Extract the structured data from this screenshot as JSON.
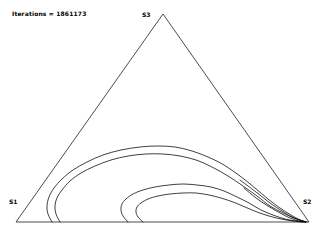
{
  "figure": {
    "iterations_label": "Iterations = 1861173",
    "iterations_prefix": "Iterations =",
    "iterations_value": "1861173",
    "line_color": "#000000",
    "background_color": "#ffffff"
  },
  "vertices": {
    "s1": {
      "label": "S1",
      "x": 16,
      "y": 222
    },
    "s2": {
      "label": "S2",
      "x": 309,
      "y": 222
    },
    "s3": {
      "label": "S3",
      "x": 163,
      "y": 14
    }
  },
  "chart_data": {
    "type": "line",
    "title": "",
    "subtitle": "",
    "xlabel": "",
    "ylabel": "",
    "grid": false,
    "legend_position": "none",
    "annotations": [
      {
        "text": "Iterations = 1861173",
        "x": 12,
        "y": 14
      },
      {
        "text": "S3",
        "x": 163,
        "y": 14
      },
      {
        "text": "S1",
        "x": 16,
        "y": 222
      },
      {
        "text": "S2",
        "x": 309,
        "y": 222
      }
    ],
    "simplex": {
      "type": "ternary-triangle",
      "corner_labels": [
        "S1",
        "S2",
        "S3"
      ],
      "corners": [
        [
          16,
          222
        ],
        [
          309,
          222
        ],
        [
          163,
          14
        ]
      ]
    },
    "series": [
      {
        "name": "outer-orbit-1",
        "points": [
          [
            52,
            222
          ],
          [
            48,
            214
          ],
          [
            47,
            206
          ],
          [
            49,
            197
          ],
          [
            54,
            188
          ],
          [
            62,
            179
          ],
          [
            73,
            170
          ],
          [
            87,
            162
          ],
          [
            103,
            155
          ],
          [
            121,
            150
          ],
          [
            140,
            147
          ],
          [
            158,
            146
          ],
          [
            175,
            147
          ],
          [
            192,
            151
          ],
          [
            208,
            157
          ],
          [
            224,
            165
          ],
          [
            240,
            176
          ],
          [
            255,
            188
          ],
          [
            268,
            199
          ],
          [
            280,
            208
          ],
          [
            291,
            215
          ],
          [
            300,
            220
          ],
          [
            306,
            222
          ]
        ]
      },
      {
        "name": "outer-orbit-2",
        "points": [
          [
            60,
            222
          ],
          [
            56,
            214
          ],
          [
            55,
            206
          ],
          [
            57,
            198
          ],
          [
            62,
            190
          ],
          [
            70,
            181
          ],
          [
            81,
            173
          ],
          [
            95,
            166
          ],
          [
            111,
            160
          ],
          [
            128,
            156
          ],
          [
            146,
            154
          ],
          [
            163,
            154
          ],
          [
            180,
            156
          ],
          [
            196,
            160
          ],
          [
            212,
            167
          ],
          [
            228,
            176
          ],
          [
            243,
            186
          ],
          [
            257,
            196
          ],
          [
            270,
            206
          ],
          [
            283,
            213
          ],
          [
            294,
            218
          ],
          [
            303,
            221
          ],
          [
            307,
            222
          ]
        ]
      },
      {
        "name": "inner-orbit-1",
        "points": [
          [
            128,
            222
          ],
          [
            123,
            216
          ],
          [
            121,
            210
          ],
          [
            122,
            204
          ],
          [
            126,
            199
          ],
          [
            133,
            194
          ],
          [
            143,
            190
          ],
          [
            155,
            187
          ],
          [
            169,
            185
          ],
          [
            183,
            184
          ],
          [
            197,
            185
          ],
          [
            211,
            187
          ],
          [
            224,
            191
          ],
          [
            237,
            197
          ],
          [
            249,
            203
          ],
          [
            261,
            210
          ],
          [
            273,
            215
          ],
          [
            285,
            219
          ],
          [
            296,
            221
          ],
          [
            305,
            222
          ]
        ]
      },
      {
        "name": "inner-orbit-2",
        "points": [
          [
            143,
            222
          ],
          [
            138,
            217
          ],
          [
            136,
            212
          ],
          [
            137,
            207
          ],
          [
            141,
            203
          ],
          [
            148,
            199
          ],
          [
            158,
            196
          ],
          [
            170,
            194
          ],
          [
            183,
            193
          ],
          [
            196,
            193
          ],
          [
            209,
            195
          ],
          [
            221,
            198
          ],
          [
            233,
            202
          ],
          [
            245,
            207
          ],
          [
            257,
            212
          ],
          [
            269,
            216
          ],
          [
            281,
            219
          ],
          [
            293,
            221
          ],
          [
            303,
            222
          ]
        ]
      },
      {
        "name": "convergence-spike",
        "points": [
          [
            240,
            180
          ],
          [
            256,
            192
          ],
          [
            270,
            203
          ],
          [
            282,
            211
          ],
          [
            292,
            217
          ],
          [
            300,
            220
          ],
          [
            306,
            222
          ],
          [
            299,
            221
          ],
          [
            290,
            218
          ],
          [
            280,
            213
          ],
          [
            268,
            206
          ],
          [
            256,
            198
          ],
          [
            244,
            188
          ]
        ]
      }
    ]
  }
}
